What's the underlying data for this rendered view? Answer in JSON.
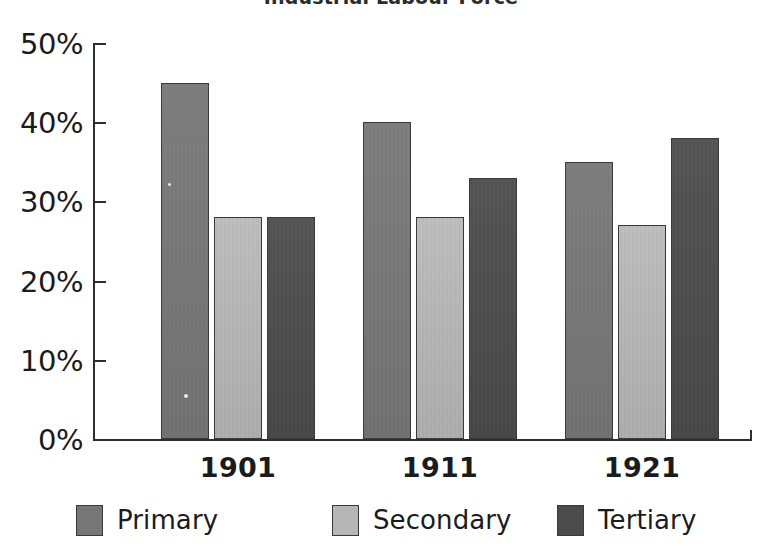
{
  "chart_data": {
    "type": "bar",
    "title": "Industrial Labour Force",
    "xlabel": "",
    "ylabel": "",
    "ylim": [
      0,
      50
    ],
    "ytick_values": [
      50,
      40,
      30,
      20,
      10,
      0
    ],
    "ytick_labels": [
      "50%",
      "40%",
      "30%",
      "20%",
      "10%",
      "0%"
    ],
    "categories": [
      "1901",
      "1911",
      "1921"
    ],
    "grid": false,
    "legend_position": "bottom",
    "value_suffix": "%",
    "series": [
      {
        "name": "Primary",
        "color": "#767676",
        "values": [
          45,
          40,
          35
        ]
      },
      {
        "name": "Secondary",
        "color": "#b6b6b6",
        "values": [
          28,
          28,
          27
        ]
      },
      {
        "name": "Tertiary",
        "color": "#4b4b4b",
        "values": [
          28,
          33,
          38
        ]
      }
    ]
  },
  "axis": {
    "line_color": "#2e2e2e"
  }
}
